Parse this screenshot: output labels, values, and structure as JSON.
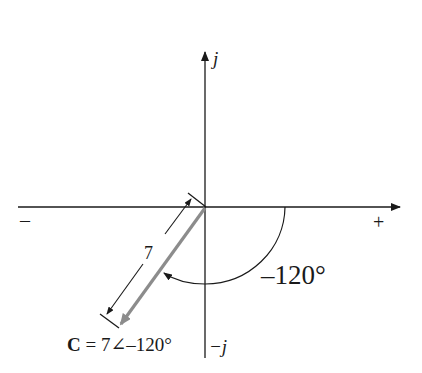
{
  "diagram": {
    "type": "phasor-diagram",
    "axes": {
      "positive_imaginary_label": "j",
      "negative_imaginary_label": "−j",
      "positive_real_label": "+",
      "negative_real_label": "–"
    },
    "phasor": {
      "name": "C",
      "magnitude": "7",
      "angle_deg": -120,
      "color": "#8c8c8c",
      "label_name": "C",
      "label_rest": " = 7∠–120°"
    },
    "magnitude_dimension_label": "7",
    "angle_label": "–120°",
    "colors": {
      "axes": "#1a1a1a",
      "phasor": "#8c8c8c",
      "background": "#ffffff"
    }
  }
}
